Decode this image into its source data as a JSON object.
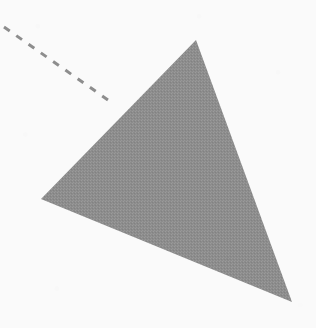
{
  "canvas": {
    "width": 316,
    "height": 328,
    "background_color": "#fafafa"
  },
  "figure": {
    "shapes": [
      {
        "name": "triangle",
        "type": "polygon",
        "label": "shaded-triangle",
        "fill_color": "#8c8c8c",
        "stroke_color": "none",
        "fill_style": "solid-dithered",
        "vertices": [
          {
            "label": "apex",
            "x": 196,
            "y": 40
          },
          {
            "label": "left",
            "x": 41,
            "y": 199
          },
          {
            "label": "bottom-right",
            "x": 292,
            "y": 302
          }
        ],
        "points_attr": "196,40 41,199 292,302"
      },
      {
        "name": "dashed-line",
        "type": "line",
        "label": "dashed-construction-line",
        "stroke_color": "#8d8d8d",
        "stroke_width": 3,
        "dash_length": 7,
        "gap_length": 8,
        "dash_array": "7 8",
        "start": {
          "x": 4,
          "y": 27
        },
        "end": {
          "x": 108,
          "y": 100
        }
      }
    ]
  }
}
